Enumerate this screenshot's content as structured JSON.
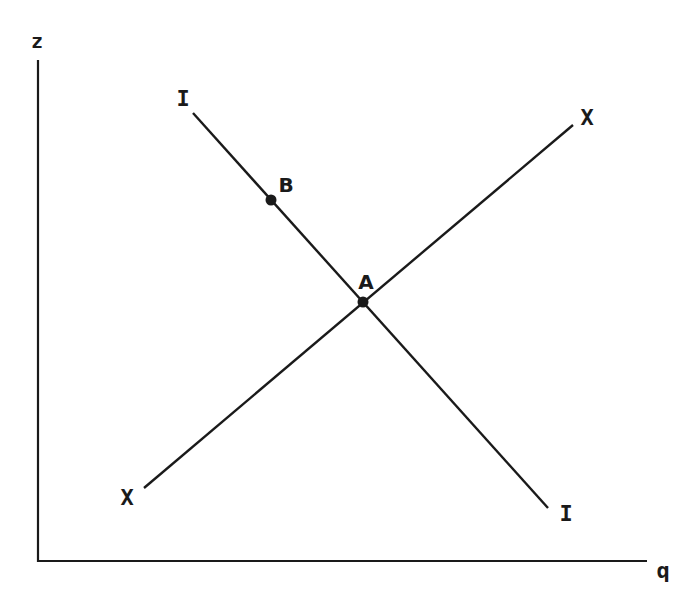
{
  "diagram": {
    "colors": {
      "ink": "#1a1a1a",
      "background": "#ffffff"
    },
    "axes": {
      "y_label": "z",
      "x_label": "q",
      "origin": [
        38,
        561
      ],
      "y_top": [
        38,
        60
      ],
      "x_end": [
        647,
        561
      ]
    },
    "curves": [
      {
        "name": "I",
        "label_start": "I",
        "label_end": "I",
        "from": [
          193,
          113
        ],
        "to": [
          548,
          508
        ]
      },
      {
        "name": "X",
        "label_start": "X",
        "label_end": "X",
        "from": [
          144,
          488
        ],
        "to": [
          573,
          125
        ]
      }
    ],
    "points": [
      {
        "name": "A",
        "label": "A",
        "at": [
          363,
          302
        ]
      },
      {
        "name": "B",
        "label": "B",
        "at": [
          271,
          200
        ]
      }
    ]
  }
}
